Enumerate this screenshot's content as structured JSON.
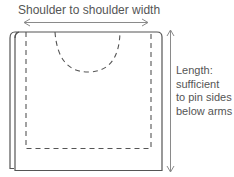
{
  "diagram": {
    "title": "Shoulder to shoulder width",
    "length_label": {
      "lines": [
        "Length:",
        "sufficient",
        "to pin sides",
        "below arms"
      ]
    },
    "elements": {
      "width_arrow": "double-headed horizontal arrow",
      "length_arrow": "double-headed vertical arrow",
      "fabric_outline": "folded fabric rectangle",
      "neckline": "dashed semicircle neckline cut",
      "seam_line": "dashed inner seam outline"
    },
    "colors": {
      "line": "#555555",
      "text": "#555555",
      "arrow": "#8a8a8a",
      "background": "#ffffff"
    }
  }
}
